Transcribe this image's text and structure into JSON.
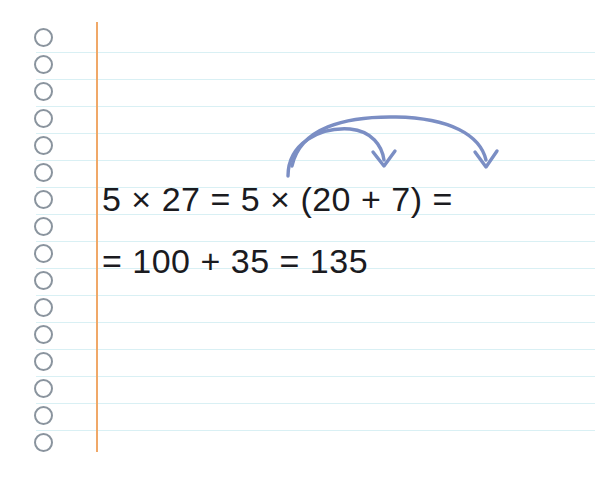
{
  "page": {
    "kind": "ruled-notebook-paper",
    "background_color": "#ffffff",
    "rule_line_color": "#d9f0f4",
    "margin_line_color": "#f0a868",
    "punch_hole_color": "#8a949e",
    "rule_line_spacing_px": 27,
    "rule_line_count": 16,
    "punch_hole_count": 16
  },
  "worked_example": {
    "topic": "distributive property of multiplication",
    "line_1": "5 × 27 = 5 × (20 + 7) =",
    "line_2": "= 100 + 35 = 135",
    "text_color": "#1b1b1f"
  },
  "annotations": {
    "arrow_color": "#7b8ec4",
    "arrows": [
      {
        "id": "distribute-to-20",
        "label": "multiplier 5 distributes onto 20",
        "from": "5",
        "to": "20"
      },
      {
        "id": "distribute-to-7",
        "label": "multiplier 5 distributes onto 7",
        "from": "5",
        "to": "7"
      }
    ]
  }
}
